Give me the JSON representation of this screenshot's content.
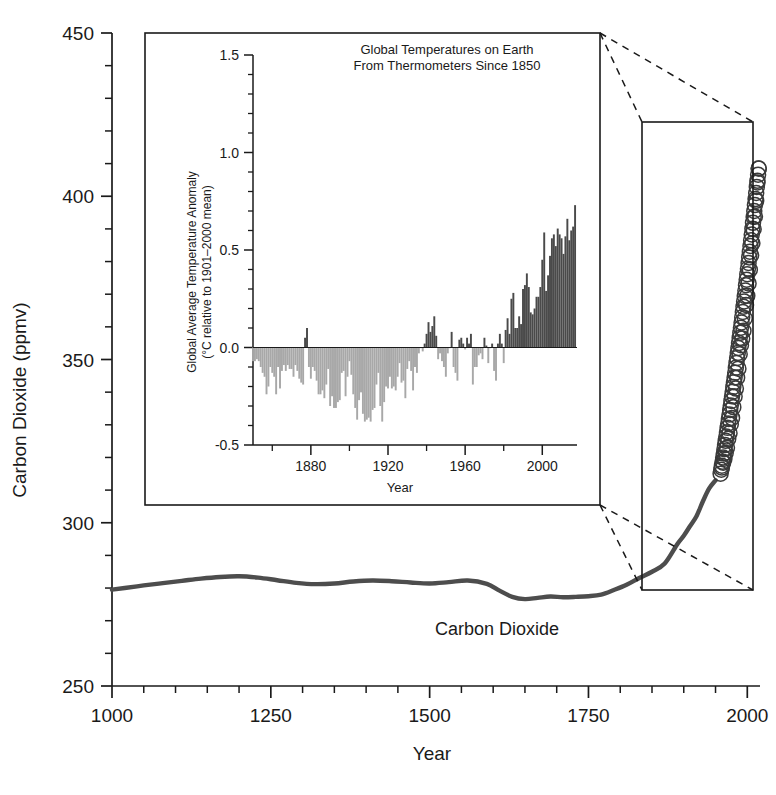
{
  "figure": {
    "name": "co2-temperature-figure",
    "background": "#ffffff"
  },
  "main_axis": {
    "ylabel": "Carbon Dioxide (ppmv)",
    "xlabel": "Year",
    "ytick_labels": [
      "450",
      "400",
      "350",
      "300",
      "250"
    ],
    "ytick_values": [
      450,
      400,
      350,
      300,
      250
    ],
    "xtick_labels": [
      "1000",
      "1250",
      "1500",
      "1750",
      "2000"
    ],
    "xtick_values": [
      1000,
      1250,
      1500,
      1750,
      2000
    ],
    "ylim": [
      250,
      450
    ],
    "xlim": [
      1000,
      2020
    ],
    "minor_ytick_step": 10,
    "minor_xtick_step": 50,
    "series_annotation": "Carbon Dioxide",
    "curve_color": "#4d4d4d",
    "marker_color": "#3a3a3a"
  },
  "inset_axis": {
    "title_line1": "Global Temperatures on Earth",
    "title_line2": "From Thermometers Since 1850",
    "ylabel_line1": "Global Average Temperature Anomaly",
    "ylabel_line2": "(°C relative to 1901–2000 mean)",
    "xlabel": "Year",
    "ytick_labels": [
      "1.5",
      "1.0",
      "0.5",
      "0.0",
      "-0.5"
    ],
    "ytick_values": [
      1.5,
      1.0,
      0.5,
      0.0,
      -0.5
    ],
    "xtick_labels": [
      "1880",
      "1920",
      "1960",
      "2000"
    ],
    "xtick_values": [
      1880,
      1920,
      1960,
      2000
    ],
    "ylim": [
      -0.5,
      1.5
    ],
    "xlim": [
      1850,
      2018
    ],
    "minor_ytick_step": 0.1,
    "minor_xtick_step": 10,
    "positive_bar_color": "#4a4a4a",
    "negative_bar_color": "#a8a8a8"
  },
  "chart_data": [
    {
      "type": "line",
      "name": "atmospheric-co2",
      "title": "",
      "xlabel": "Year",
      "ylabel": "Carbon Dioxide (ppmv)",
      "xlim": [
        1000,
        2020
      ],
      "ylim": [
        250,
        450
      ],
      "grid": false,
      "legend": "none",
      "annotation": "Carbon Dioxide",
      "series": [
        {
          "name": "Ice-core record (line)",
          "x": [
            1000,
            1020,
            1050,
            1080,
            1110,
            1140,
            1170,
            1200,
            1230,
            1260,
            1290,
            1320,
            1350,
            1380,
            1410,
            1440,
            1470,
            1500,
            1530,
            1560,
            1590,
            1610,
            1630,
            1650,
            1670,
            1690,
            1710,
            1730,
            1750,
            1770,
            1790,
            1810,
            1830,
            1850,
            1870,
            1890,
            1900,
            1910,
            1920,
            1930,
            1940,
            1950
          ],
          "y": [
            279.5,
            280.0,
            280.8,
            281.5,
            282.2,
            282.9,
            283.4,
            283.6,
            283.2,
            282.4,
            281.6,
            281.2,
            281.4,
            282.0,
            282.3,
            282.1,
            281.7,
            281.4,
            281.8,
            282.3,
            281.3,
            279.2,
            277.3,
            276.6,
            277.0,
            277.4,
            277.2,
            277.3,
            277.5,
            278.0,
            279.4,
            281.0,
            283.1,
            285.0,
            287.5,
            293.5,
            296.0,
            299.0,
            302.0,
            306.5,
            310.5,
            313.0
          ]
        },
        {
          "name": "Direct measurements (open circles)",
          "x": [
            1958,
            1960,
            1962,
            1964,
            1966,
            1968,
            1970,
            1972,
            1974,
            1976,
            1978,
            1980,
            1982,
            1984,
            1986,
            1988,
            1990,
            1992,
            1994,
            1996,
            1998,
            2000,
            2002,
            2004,
            2006,
            2008,
            2010,
            2012,
            2014,
            2016,
            2018
          ],
          "y": [
            315.0,
            316.9,
            318.4,
            319.6,
            321.4,
            323.0,
            325.7,
            327.4,
            330.2,
            332.1,
            335.4,
            338.7,
            341.1,
            344.4,
            347.2,
            351.6,
            354.4,
            356.4,
            358.8,
            362.6,
            366.7,
            369.5,
            373.3,
            377.5,
            381.9,
            385.6,
            389.9,
            393.8,
            398.6,
            404.2,
            408.5
          ]
        }
      ]
    },
    {
      "type": "bar",
      "name": "global-temperature-anomaly",
      "title": "Global Temperatures on Earth From Thermometers Since 1850",
      "xlabel": "Year",
      "ylabel": "Global Average Temperature Anomaly (°C relative to 1901–2000 mean)",
      "xlim": [
        1850,
        2018
      ],
      "ylim": [
        -0.5,
        1.5
      ],
      "grid": false,
      "legend": "none",
      "baseline": 0.0,
      "categories": [
        1850,
        1851,
        1852,
        1853,
        1854,
        1855,
        1856,
        1857,
        1858,
        1859,
        1860,
        1861,
        1862,
        1863,
        1864,
        1865,
        1866,
        1867,
        1868,
        1869,
        1870,
        1871,
        1872,
        1873,
        1874,
        1875,
        1876,
        1877,
        1878,
        1879,
        1880,
        1881,
        1882,
        1883,
        1884,
        1885,
        1886,
        1887,
        1888,
        1889,
        1890,
        1891,
        1892,
        1893,
        1894,
        1895,
        1896,
        1897,
        1898,
        1899,
        1900,
        1901,
        1902,
        1903,
        1904,
        1905,
        1906,
        1907,
        1908,
        1909,
        1910,
        1911,
        1912,
        1913,
        1914,
        1915,
        1916,
        1917,
        1918,
        1919,
        1920,
        1921,
        1922,
        1923,
        1924,
        1925,
        1926,
        1927,
        1928,
        1929,
        1930,
        1931,
        1932,
        1933,
        1934,
        1935,
        1936,
        1937,
        1938,
        1939,
        1940,
        1941,
        1942,
        1943,
        1944,
        1945,
        1946,
        1947,
        1948,
        1949,
        1950,
        1951,
        1952,
        1953,
        1954,
        1955,
        1956,
        1957,
        1958,
        1959,
        1960,
        1961,
        1962,
        1963,
        1964,
        1965,
        1966,
        1967,
        1968,
        1969,
        1970,
        1971,
        1972,
        1973,
        1974,
        1975,
        1976,
        1977,
        1978,
        1979,
        1980,
        1981,
        1982,
        1983,
        1984,
        1985,
        1986,
        1987,
        1988,
        1989,
        1990,
        1991,
        1992,
        1993,
        1994,
        1995,
        1996,
        1997,
        1998,
        1999,
        2000,
        2001,
        2002,
        2003,
        2004,
        2005,
        2006,
        2007,
        2008,
        2009,
        2010,
        2011,
        2012,
        2013,
        2014,
        2015,
        2016,
        2017
      ],
      "values": [
        -0.07,
        -0.07,
        -0.06,
        -0.07,
        -0.1,
        -0.13,
        -0.15,
        -0.24,
        -0.2,
        -0.1,
        -0.13,
        -0.15,
        -0.24,
        -0.1,
        -0.21,
        -0.12,
        -0.09,
        -0.12,
        -0.09,
        -0.11,
        -0.11,
        -0.15,
        -0.09,
        -0.12,
        -0.16,
        -0.18,
        -0.19,
        0.05,
        0.1,
        -0.1,
        -0.16,
        -0.1,
        -0.12,
        -0.17,
        -0.24,
        -0.24,
        -0.22,
        -0.26,
        -0.19,
        -0.11,
        -0.3,
        -0.25,
        -0.31,
        -0.31,
        -0.28,
        -0.27,
        -0.13,
        -0.12,
        -0.25,
        -0.15,
        -0.07,
        -0.14,
        -0.24,
        -0.31,
        -0.37,
        -0.27,
        -0.23,
        -0.34,
        -0.38,
        -0.37,
        -0.36,
        -0.38,
        -0.32,
        -0.31,
        -0.19,
        -0.13,
        -0.3,
        -0.38,
        -0.28,
        -0.2,
        -0.21,
        -0.15,
        -0.21,
        -0.2,
        -0.22,
        -0.15,
        -0.08,
        -0.18,
        -0.17,
        -0.26,
        -0.11,
        -0.07,
        -0.12,
        -0.22,
        -0.1,
        -0.13,
        -0.03,
        0.0,
        -0.02,
        0.02,
        0.07,
        0.13,
        0.08,
        0.11,
        0.16,
        0.06,
        -0.06,
        -0.03,
        -0.07,
        -0.1,
        -0.15,
        -0.03,
        0.0,
        0.08,
        -0.1,
        -0.13,
        -0.17,
        0.04,
        0.05,
        0.02,
        -0.01,
        0.05,
        0.02,
        0.07,
        -0.19,
        -0.1,
        -0.1,
        -0.04,
        -0.03,
        -0.06,
        0.05,
        0.01,
        -0.08,
        0.0,
        0.02,
        -0.12,
        -0.17,
        0.02,
        0.07,
        0.02,
        -0.08,
        0.09,
        0.15,
        0.07,
        0.25,
        0.28,
        0.1,
        0.1,
        0.16,
        0.12,
        0.3,
        0.32,
        0.38,
        0.31,
        0.18,
        0.17,
        0.2,
        0.26,
        0.26,
        0.31,
        0.45,
        0.59,
        0.29,
        0.37,
        0.47,
        0.56,
        0.58,
        0.52,
        0.61,
        0.58,
        0.56,
        0.48,
        0.57,
        0.66,
        0.55,
        0.6,
        0.62,
        0.73,
        0.88,
        1.02,
        0.92
      ]
    }
  ],
  "annotations": {
    "connector_style": "dashed",
    "connector_count": 4
  }
}
